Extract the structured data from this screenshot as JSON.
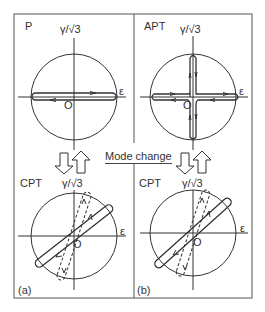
{
  "figure": {
    "mode_change_label": "Mode change",
    "panels": [
      {
        "id": "P",
        "label": "P",
        "y_axis": "γ/√3",
        "x_axis": "ε",
        "origin": "O",
        "sublabel": ""
      },
      {
        "id": "APT",
        "label": "APT",
        "y_axis": "γ/√3",
        "x_axis": "ε",
        "origin": "O",
        "sublabel": ""
      },
      {
        "id": "CPT-a",
        "label": "CPT",
        "y_axis": "γ/√3",
        "x_axis": "ε",
        "origin": "O",
        "sublabel": "(a)"
      },
      {
        "id": "CPT-b",
        "label": "CPT",
        "y_axis": "γ/√3",
        "x_axis": "ε",
        "origin": "O",
        "sublabel": "(b)"
      }
    ],
    "colors": {
      "line": "#333333",
      "background": "#ffffff"
    }
  }
}
